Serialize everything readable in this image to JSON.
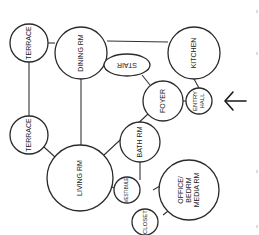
{
  "diagram": {
    "type": "bubble-adjacency-diagram",
    "colors": {
      "stroke": "#2a2a2a",
      "fill": "#ffffff",
      "text": "#222222",
      "background": "#ffffff"
    },
    "nodes": {
      "terrace_top": {
        "label": "TERRACE"
      },
      "dining": {
        "label": "DINING RM"
      },
      "kitchen": {
        "label": "KITCHEN"
      },
      "stair": {
        "label": "STAIR"
      },
      "foyer": {
        "label": "FOYER"
      },
      "entry_hall": {
        "line1": "ENTRY",
        "line2": "HALL"
      },
      "terrace_bottom": {
        "label": "TERRACE"
      },
      "living": {
        "label": "LIVING RM"
      },
      "bath": {
        "label": "BATH RM"
      },
      "vestibule": {
        "label": "VESTIBULE"
      },
      "office": {
        "line1": "OFFICE/",
        "line2": "BEDRM",
        "line3": "MEDIA RM"
      },
      "closet": {
        "label": "CLOSET"
      }
    },
    "edges": [
      [
        "terrace_top",
        "dining"
      ],
      [
        "terrace_top",
        "terrace_bottom"
      ],
      [
        "dining",
        "kitchen"
      ],
      [
        "dining",
        "living"
      ],
      [
        "kitchen",
        "entry_hall"
      ],
      [
        "stair",
        "foyer"
      ],
      [
        "foyer",
        "entry_hall"
      ],
      [
        "foyer",
        "living"
      ],
      [
        "terrace_bottom",
        "living"
      ],
      [
        "living",
        "vestibule"
      ],
      [
        "bath",
        "vestibule"
      ],
      [
        "vestibule",
        "office"
      ],
      [
        "office",
        "closet"
      ]
    ],
    "entrance_arrow": {
      "target": "entry_hall",
      "direction": "left"
    }
  }
}
